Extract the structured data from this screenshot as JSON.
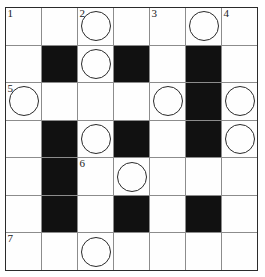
{
  "puzzle": {
    "type": "crossword-grid",
    "rows": 7,
    "columns": 7,
    "colors": {
      "block_fill": "#111111",
      "cell_fill": "#fefefe",
      "grid_line": "#8c8c8c",
      "border": "#2b2b2b",
      "circle_stroke": "#2a2a2a",
      "number_color": "#1a1a1a"
    },
    "cells": [
      [
        {
          "block": false,
          "number": "1",
          "circle": false,
          "letter": ""
        },
        {
          "block": false,
          "number": "",
          "circle": false,
          "letter": ""
        },
        {
          "block": false,
          "number": "2",
          "circle": true,
          "letter": ""
        },
        {
          "block": false,
          "number": "",
          "circle": false,
          "letter": ""
        },
        {
          "block": false,
          "number": "3",
          "circle": false,
          "letter": ""
        },
        {
          "block": false,
          "number": "",
          "circle": true,
          "letter": ""
        },
        {
          "block": false,
          "number": "4",
          "circle": false,
          "letter": ""
        }
      ],
      [
        {
          "block": false,
          "number": "",
          "circle": false,
          "letter": ""
        },
        {
          "block": true,
          "number": "",
          "circle": false,
          "letter": ""
        },
        {
          "block": false,
          "number": "",
          "circle": true,
          "letter": ""
        },
        {
          "block": true,
          "number": "",
          "circle": false,
          "letter": ""
        },
        {
          "block": false,
          "number": "",
          "circle": false,
          "letter": ""
        },
        {
          "block": true,
          "number": "",
          "circle": false,
          "letter": ""
        },
        {
          "block": false,
          "number": "",
          "circle": false,
          "letter": ""
        }
      ],
      [
        {
          "block": false,
          "number": "5",
          "circle": true,
          "letter": ""
        },
        {
          "block": false,
          "number": "",
          "circle": false,
          "letter": ""
        },
        {
          "block": false,
          "number": "",
          "circle": false,
          "letter": ""
        },
        {
          "block": false,
          "number": "",
          "circle": false,
          "letter": ""
        },
        {
          "block": false,
          "number": "",
          "circle": true,
          "letter": ""
        },
        {
          "block": true,
          "number": "",
          "circle": false,
          "letter": ""
        },
        {
          "block": false,
          "number": "",
          "circle": true,
          "letter": ""
        }
      ],
      [
        {
          "block": false,
          "number": "",
          "circle": false,
          "letter": ""
        },
        {
          "block": true,
          "number": "",
          "circle": false,
          "letter": ""
        },
        {
          "block": false,
          "number": "",
          "circle": true,
          "letter": ""
        },
        {
          "block": true,
          "number": "",
          "circle": false,
          "letter": ""
        },
        {
          "block": false,
          "number": "",
          "circle": false,
          "letter": ""
        },
        {
          "block": true,
          "number": "",
          "circle": false,
          "letter": ""
        },
        {
          "block": false,
          "number": "",
          "circle": true,
          "letter": ""
        }
      ],
      [
        {
          "block": false,
          "number": "",
          "circle": false,
          "letter": ""
        },
        {
          "block": true,
          "number": "",
          "circle": false,
          "letter": ""
        },
        {
          "block": false,
          "number": "6",
          "circle": false,
          "letter": ""
        },
        {
          "block": false,
          "number": "",
          "circle": true,
          "letter": ""
        },
        {
          "block": false,
          "number": "",
          "circle": false,
          "letter": ""
        },
        {
          "block": false,
          "number": "",
          "circle": false,
          "letter": ""
        },
        {
          "block": false,
          "number": "",
          "circle": false,
          "letter": ""
        }
      ],
      [
        {
          "block": false,
          "number": "",
          "circle": false,
          "letter": ""
        },
        {
          "block": true,
          "number": "",
          "circle": false,
          "letter": ""
        },
        {
          "block": false,
          "number": "",
          "circle": false,
          "letter": ""
        },
        {
          "block": true,
          "number": "",
          "circle": false,
          "letter": ""
        },
        {
          "block": false,
          "number": "",
          "circle": false,
          "letter": ""
        },
        {
          "block": true,
          "number": "",
          "circle": false,
          "letter": ""
        },
        {
          "block": false,
          "number": "",
          "circle": false,
          "letter": ""
        }
      ],
      [
        {
          "block": false,
          "number": "7",
          "circle": false,
          "letter": ""
        },
        {
          "block": false,
          "number": "",
          "circle": false,
          "letter": ""
        },
        {
          "block": false,
          "number": "",
          "circle": true,
          "letter": ""
        },
        {
          "block": false,
          "number": "",
          "circle": false,
          "letter": ""
        },
        {
          "block": false,
          "number": "",
          "circle": false,
          "letter": ""
        },
        {
          "block": false,
          "number": "",
          "circle": false,
          "letter": ""
        },
        {
          "block": false,
          "number": "",
          "circle": false,
          "letter": ""
        }
      ]
    ]
  }
}
